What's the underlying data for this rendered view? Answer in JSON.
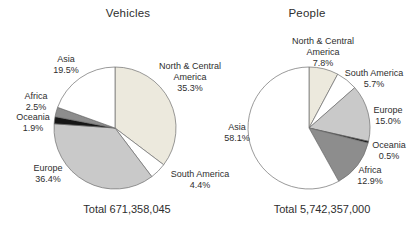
{
  "figure": {
    "background": "#ffffff",
    "text_color": "#2e2e2e",
    "slice_stroke_color": "#6f6f6f"
  },
  "chart_data": [
    {
      "type": "pie",
      "title": "Vehicles",
      "total_label": "Total 671,358,045",
      "start_angle_deg": -90,
      "direction": "clockwise",
      "legend_position": "outside-labels",
      "slices": [
        {
          "name": "North & Central America",
          "pct": 35.3,
          "pct_label": "35.3%",
          "color": "#ece9dd"
        },
        {
          "name": "South America",
          "pct": 4.4,
          "pct_label": "4.4%",
          "color": "#ffffff"
        },
        {
          "name": "Europe",
          "pct": 36.4,
          "pct_label": "36.4%",
          "color": "#c9c9c9"
        },
        {
          "name": "Oceania",
          "pct": 1.9,
          "pct_label": "1.9%",
          "color": "#161616"
        },
        {
          "name": "Africa",
          "pct": 2.5,
          "pct_label": "2.5%",
          "color": "#8d8d8d"
        },
        {
          "name": "Asia",
          "pct": 19.5,
          "pct_label": "19.5%",
          "color": "#ffffff"
        }
      ]
    },
    {
      "type": "pie",
      "title": "People",
      "total_label": "Total 5,742,357,000",
      "start_angle_deg": -90,
      "direction": "clockwise",
      "legend_position": "outside-labels",
      "slices": [
        {
          "name": "North & Central America",
          "pct": 7.8,
          "pct_label": "7.8%",
          "color": "#ece9dd"
        },
        {
          "name": "South America",
          "pct": 5.7,
          "pct_label": "5.7%",
          "color": "#ffffff"
        },
        {
          "name": "Europe",
          "pct": 15.0,
          "pct_label": "15.0%",
          "color": "#c9c9c9"
        },
        {
          "name": "Oceania",
          "pct": 0.5,
          "pct_label": "0.5%",
          "color": "#161616"
        },
        {
          "name": "Africa",
          "pct": 12.9,
          "pct_label": "12.9%",
          "color": "#8d8d8d"
        },
        {
          "name": "Asia",
          "pct": 58.1,
          "pct_label": "58.1%",
          "color": "#ffffff"
        }
      ]
    }
  ]
}
